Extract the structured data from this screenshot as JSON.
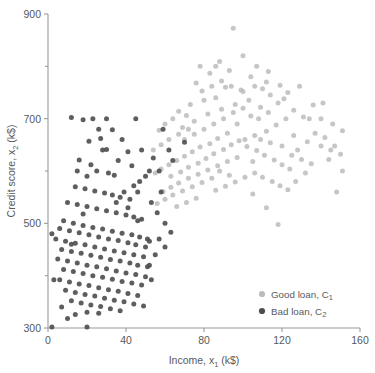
{
  "chart_data": {
    "type": "scatter",
    "title": "",
    "xlabel": "Income, x₁ (k$)",
    "xlabel_main": "Income, x",
    "xlabel_sub": "1",
    "xlabel_unit": " (k$)",
    "ylabel": "Credit score, x₂ (k$)",
    "ylabel_main": "Credit score, x",
    "ylabel_sub": "2",
    "ylabel_unit": " (k$)",
    "xlim": [
      0,
      160
    ],
    "ylim": [
      300,
      900
    ],
    "xticks": [
      0,
      40,
      80,
      120,
      160
    ],
    "xticklabels": [
      "0",
      "40",
      "80",
      "120",
      "160"
    ],
    "yticks": [
      300,
      500,
      700,
      900
    ],
    "yticklabels": [
      "300",
      "500",
      "700",
      "900"
    ],
    "yminorticks": [
      400,
      600,
      800
    ],
    "grid": false,
    "legend_position": "lower-right",
    "series": [
      {
        "name": "Good loan, C₁",
        "name_main": "Good loan, C",
        "name_sub": "1",
        "color": "#bcbcbc",
        "marker": "circle",
        "marker_size": 5.0,
        "points": [
          [
            95,
            873
          ],
          [
            88,
            809
          ],
          [
            83,
            787
          ],
          [
            76,
            768
          ],
          [
            93,
            792
          ],
          [
            104,
            780
          ],
          [
            99,
            755
          ],
          [
            110,
            757
          ],
          [
            119,
            764
          ],
          [
            86,
            740
          ],
          [
            80,
            735
          ],
          [
            73,
            727
          ],
          [
            67,
            714
          ],
          [
            71,
            706
          ],
          [
            64,
            700
          ],
          [
            60,
            690
          ],
          [
            57,
            678
          ],
          [
            69,
            683
          ],
          [
            75,
            695
          ],
          [
            82,
            709
          ],
          [
            89,
            718
          ],
          [
            96,
            727
          ],
          [
            103,
            735
          ],
          [
            109,
            722
          ],
          [
            114,
            745
          ],
          [
            121,
            738
          ],
          [
            126,
            716
          ],
          [
            131,
            703
          ],
          [
            136,
            726
          ],
          [
            140,
            700
          ],
          [
            146,
            690
          ],
          [
            151,
            677
          ],
          [
            129,
            762
          ],
          [
            122,
            700
          ],
          [
            117,
            688
          ],
          [
            112,
            676
          ],
          [
            106,
            668
          ],
          [
            101,
            660
          ],
          [
            97,
            690
          ],
          [
            92,
            672
          ],
          [
            87,
            662
          ],
          [
            83,
            652
          ],
          [
            78,
            646
          ],
          [
            74,
            637
          ],
          [
            70,
            628
          ],
          [
            66,
            620
          ],
          [
            62,
            612
          ],
          [
            58,
            604
          ],
          [
            55,
            596
          ],
          [
            63,
            590
          ],
          [
            68,
            598
          ],
          [
            72,
            607
          ],
          [
            77,
            615
          ],
          [
            81,
            624
          ],
          [
            85,
            633
          ],
          [
            90,
            641
          ],
          [
            94,
            650
          ],
          [
            98,
            658
          ],
          [
            102,
            647
          ],
          [
            107,
            639
          ],
          [
            111,
            630
          ],
          [
            116,
            621
          ],
          [
            120,
            612
          ],
          [
            124,
            604
          ],
          [
            128,
            640
          ],
          [
            133,
            656
          ],
          [
            137,
            672
          ],
          [
            142,
            664
          ],
          [
            147,
            648
          ],
          [
            88,
            600
          ],
          [
            93,
            592
          ],
          [
            84,
            586
          ],
          [
            79,
            578
          ],
          [
            74,
            570
          ],
          [
            69,
            562
          ],
          [
            64,
            554
          ],
          [
            60,
            546
          ],
          [
            56,
            538
          ],
          [
            66,
            532
          ],
          [
            71,
            540
          ],
          [
            76,
            548
          ],
          [
            86,
            563
          ],
          [
            91,
            571
          ],
          [
            96,
            579
          ],
          [
            101,
            588
          ],
          [
            106,
            596
          ],
          [
            110,
            588
          ],
          [
            115,
            580
          ],
          [
            119,
            572
          ],
          [
            123,
            564
          ],
          [
            127,
            580
          ],
          [
            132,
            596
          ],
          [
            100,
            720
          ],
          [
            95,
            712
          ],
          [
            104,
            705
          ],
          [
            108,
            700
          ],
          [
            113,
            712
          ],
          [
            118,
            730
          ],
          [
            123,
            750
          ],
          [
            112,
            770
          ],
          [
            106,
            762
          ],
          [
            100,
            752
          ],
          [
            94,
            762
          ],
          [
            89,
            772
          ],
          [
            84,
            762
          ],
          [
            79,
            753
          ],
          [
            90,
            700
          ],
          [
            85,
            690
          ],
          [
            80,
            680
          ],
          [
            75,
            670
          ],
          [
            70,
            660
          ],
          [
            112,
            530
          ],
          [
            118,
            498
          ],
          [
            105,
            556
          ],
          [
            126,
            668
          ],
          [
            134,
            700
          ],
          [
            141,
            730
          ],
          [
            148,
            560
          ],
          [
            144,
            622
          ],
          [
            151,
            600
          ],
          [
            62,
            660
          ],
          [
            58,
            650
          ],
          [
            54,
            640
          ],
          [
            67,
            670
          ],
          [
            72,
            680
          ],
          [
            105,
            618
          ],
          [
            109,
            660
          ],
          [
            114,
            654
          ],
          [
            120,
            648
          ],
          [
            125,
            630
          ],
          [
            130,
            622
          ],
          [
            135,
            614
          ],
          [
            140,
            648
          ],
          [
            145,
            640
          ],
          [
            150,
            632
          ],
          [
            97,
            626
          ],
          [
            92,
            618
          ],
          [
            87,
            610
          ],
          [
            82,
            602
          ],
          [
            77,
            594
          ],
          [
            72,
            586
          ],
          [
            67,
            577
          ],
          [
            63,
            569
          ],
          [
            59,
            561
          ],
          [
            100,
            820
          ],
          [
            107,
            800
          ],
          [
            113,
            790
          ],
          [
            91,
            760
          ],
          [
            86,
            800
          ],
          [
            78,
            800
          ]
        ]
      },
      {
        "name": "Bad loan, C₂",
        "name_main": "Bad loan, C",
        "name_sub": "2",
        "color": "#4d4d4d",
        "marker": "circle",
        "marker_size": 5.0,
        "points": [
          [
            12,
            702
          ],
          [
            18,
            698
          ],
          [
            23,
            700
          ],
          [
            27,
            662
          ],
          [
            21,
            657
          ],
          [
            30,
            641
          ],
          [
            16,
            621
          ],
          [
            25,
            600
          ],
          [
            31,
            596
          ],
          [
            20,
            590
          ],
          [
            34,
            592
          ],
          [
            38,
            660
          ],
          [
            41,
            637
          ],
          [
            14,
            570
          ],
          [
            19,
            566
          ],
          [
            24,
            562
          ],
          [
            29,
            558
          ],
          [
            33,
            554
          ],
          [
            37,
            550
          ],
          [
            42,
            546
          ],
          [
            46,
            560
          ],
          [
            10,
            540
          ],
          [
            15,
            536
          ],
          [
            20,
            532
          ],
          [
            25,
            528
          ],
          [
            30,
            524
          ],
          [
            35,
            520
          ],
          [
            40,
            516
          ],
          [
            44,
            512
          ],
          [
            48,
            508
          ],
          [
            8,
            505
          ],
          [
            13,
            500
          ],
          [
            18,
            496
          ],
          [
            23,
            492
          ],
          [
            28,
            489
          ],
          [
            33,
            485
          ],
          [
            38,
            481
          ],
          [
            43,
            478
          ],
          [
            47,
            474
          ],
          [
            51,
            470
          ],
          [
            6,
            490
          ],
          [
            11,
            486
          ],
          [
            16,
            482
          ],
          [
            21,
            478
          ],
          [
            26,
            474
          ],
          [
            31,
            470
          ],
          [
            36,
            467
          ],
          [
            41,
            463
          ],
          [
            45,
            459
          ],
          [
            50,
            455
          ],
          [
            4,
            470
          ],
          [
            9,
            466
          ],
          [
            14,
            462
          ],
          [
            19,
            459
          ],
          [
            24,
            455
          ],
          [
            29,
            451
          ],
          [
            34,
            447
          ],
          [
            39,
            444
          ],
          [
            44,
            440
          ],
          [
            49,
            436
          ],
          [
            7,
            450
          ],
          [
            12,
            446
          ],
          [
            17,
            443
          ],
          [
            22,
            439
          ],
          [
            27,
            435
          ],
          [
            32,
            431
          ],
          [
            37,
            428
          ],
          [
            42,
            424
          ],
          [
            46,
            420
          ],
          [
            51,
            417
          ],
          [
            5,
            432
          ],
          [
            10,
            428
          ],
          [
            15,
            424
          ],
          [
            20,
            420
          ],
          [
            25,
            417
          ],
          [
            30,
            413
          ],
          [
            35,
            409
          ],
          [
            40,
            405
          ],
          [
            45,
            402
          ],
          [
            50,
            398
          ],
          [
            8,
            412
          ],
          [
            13,
            408
          ],
          [
            18,
            404
          ],
          [
            23,
            400
          ],
          [
            28,
            397
          ],
          [
            33,
            393
          ],
          [
            38,
            389
          ],
          [
            43,
            386
          ],
          [
            48,
            382
          ],
          [
            53,
            392
          ],
          [
            6,
            392
          ],
          [
            11,
            388
          ],
          [
            16,
            384
          ],
          [
            21,
            381
          ],
          [
            26,
            377
          ],
          [
            31,
            373
          ],
          [
            36,
            370
          ],
          [
            41,
            366
          ],
          [
            46,
            362
          ],
          [
            52,
            420
          ],
          [
            9,
            372
          ],
          [
            14,
            368
          ],
          [
            19,
            364
          ],
          [
            24,
            361
          ],
          [
            29,
            357
          ],
          [
            34,
            353
          ],
          [
            39,
            350
          ],
          [
            44,
            346
          ],
          [
            49,
            342
          ],
          [
            55,
            440
          ],
          [
            12,
            352
          ],
          [
            17,
            348
          ],
          [
            22,
            344
          ],
          [
            27,
            341
          ],
          [
            32,
            337
          ],
          [
            37,
            333
          ],
          [
            7,
            340
          ],
          [
            20,
            330
          ],
          [
            26,
            328
          ],
          [
            14,
            326
          ],
          [
            2,
            480
          ],
          [
            3,
            392
          ],
          [
            2,
            302
          ],
          [
            20,
            302
          ],
          [
            10,
            318
          ],
          [
            57,
            470
          ],
          [
            56,
            520
          ],
          [
            60,
            500
          ],
          [
            53,
            540
          ],
          [
            47,
            580
          ],
          [
            52,
            600
          ],
          [
            58,
            560
          ],
          [
            63,
            483
          ],
          [
            43,
            610
          ],
          [
            36,
            620
          ],
          [
            28,
            640
          ],
          [
            22,
            612
          ],
          [
            15,
            600
          ],
          [
            62,
            640
          ],
          [
            57,
            600
          ],
          [
            48,
            640
          ],
          [
            44,
            572
          ],
          [
            50,
            590
          ],
          [
            54,
            625
          ],
          [
            33,
            679
          ],
          [
            39,
            560
          ],
          [
            35,
            540
          ],
          [
            41,
            530
          ],
          [
            46,
            505
          ],
          [
            52,
            466
          ],
          [
            60,
            455
          ],
          [
            64,
            620
          ],
          [
            59,
            680
          ],
          [
            30,
            700
          ],
          [
            26,
            680
          ],
          [
            12,
            460
          ],
          [
            18,
            518
          ],
          [
            45,
            700
          ],
          [
            70,
            655
          ]
        ]
      }
    ]
  },
  "axes": {
    "plot_left_px": 48,
    "plot_right_px": 360,
    "plot_top_px": 14,
    "plot_bottom_px": 328
  }
}
